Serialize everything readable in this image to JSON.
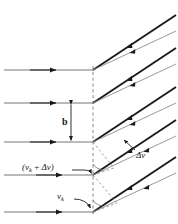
{
  "figure": {
    "background_color": "#ffffff",
    "stroke_color_primary": "#1a1a1a",
    "stroke_color_secondary": "#9a9a9a",
    "dashed_color": "#8c8c8c",
    "width_px": 178,
    "height_px": 224
  },
  "labels": {
    "gap_label": "b",
    "velocity_plus_delta": "(vₖ + Δv)",
    "velocity_plus_delta_parts": {
      "open": "(",
      "v": "v",
      "sub": "k",
      "plus": " + ",
      "delta": "Δv",
      "close": ")"
    },
    "velocity_base": "vₖ",
    "velocity_base_parts": {
      "v": "v",
      "sub": "k"
    },
    "delta_v": "Δv"
  },
  "geometry": {
    "wall_x": 93,
    "stream_line_y": [
      70,
      103,
      142,
      175,
      212
    ],
    "slant_dx": 85,
    "slant_dy": -46,
    "gap_b_top_y": 103,
    "gap_b_bottom_y": 142,
    "gap_b_x": 71
  },
  "elements": {
    "streamlines_count": 5,
    "slant_pairs_count": 5,
    "arrow_style": "filled-triangle",
    "wall_style": "dashed-vertical"
  }
}
